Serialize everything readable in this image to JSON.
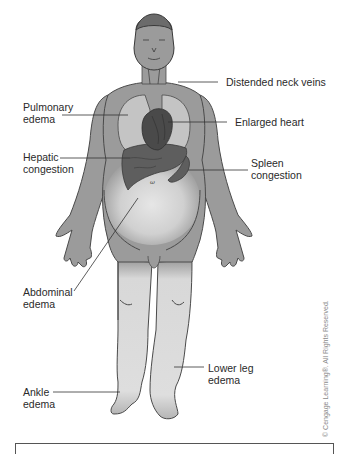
{
  "diagram": {
    "colors": {
      "skin": "#9b9b9b",
      "outline": "#4a4a4a",
      "organ": "#5a5a5a",
      "lung": "#c4c4c4",
      "edema": "#dcdcdc",
      "leader_line": "#333333"
    },
    "labels": [
      {
        "id": "distended-neck-veins",
        "text": "Distended neck veins"
      },
      {
        "id": "pulmonary-edema",
        "text": "Pulmonary\nedema"
      },
      {
        "id": "enlarged-heart",
        "text": "Enlarged heart"
      },
      {
        "id": "hepatic-congestion",
        "text": "Hepatic\ncongestion"
      },
      {
        "id": "spleen-congestion",
        "text": "Spleen\ncongestion"
      },
      {
        "id": "abdominal-edema",
        "text": "Abdominal\nedema"
      },
      {
        "id": "lower-leg-edema",
        "text": "Lower leg\nedema"
      },
      {
        "id": "ankle-edema",
        "text": "Ankle\nedema"
      }
    ],
    "copyright": "© Cengage Learning®. All Rights Reserved."
  }
}
